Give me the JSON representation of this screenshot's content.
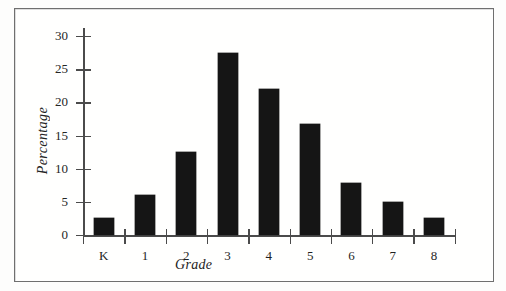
{
  "figure": {
    "frame_visible": true,
    "background_color": "#fffffe",
    "border_color": "#6f6f6f",
    "bar_color": "#151515",
    "axis_color": "#4b4b4b",
    "text_color": "#232323"
  },
  "chart_data": {
    "type": "bar",
    "title": "",
    "subtitle": "",
    "xlabel": "Grade",
    "ylabel": "Percentage",
    "categories": [
      "K",
      "1",
      "2",
      "3",
      "4",
      "5",
      "6",
      "7",
      "8"
    ],
    "values": [
      2.5,
      6,
      12.5,
      27.5,
      22,
      16.8,
      7.8,
      5,
      2.5
    ],
    "ylim": [
      0,
      30
    ],
    "yticks": [
      0,
      5,
      10,
      15,
      20,
      25,
      30
    ],
    "ytick_labels": [
      "0",
      "5",
      "10",
      "15",
      "20",
      "25",
      "30"
    ],
    "grid": false,
    "legend": false,
    "legend_position": "none",
    "annotations": []
  }
}
